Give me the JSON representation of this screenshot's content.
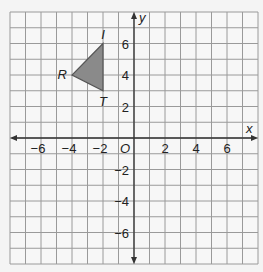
{
  "chart_data": {
    "type": "coordinate-plane",
    "xlabel": "x",
    "ylabel": "y",
    "origin_label": "O",
    "xlim": [
      -8,
      8
    ],
    "ylim": [
      -8,
      8
    ],
    "grid": true,
    "grid_step": 1,
    "x_ticks": [
      -6,
      -4,
      -2,
      2,
      4,
      6
    ],
    "y_ticks": [
      6,
      4,
      2,
      -2,
      -4,
      -6
    ],
    "shapes": [
      {
        "type": "triangle",
        "fill": "#8a8a8a",
        "vertices": [
          {
            "label": "I",
            "x": -2,
            "y": 6
          },
          {
            "label": "R",
            "x": -4,
            "y": 4
          },
          {
            "label": "T",
            "x": -2,
            "y": 3
          }
        ]
      }
    ]
  },
  "colors": {
    "grid": "#9a9a9a",
    "axis": "#333333",
    "background": "#f7f7f7"
  }
}
